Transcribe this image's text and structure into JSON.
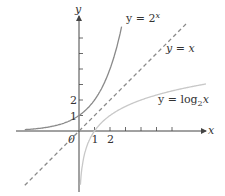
{
  "chart_data": {
    "type": "line",
    "title": "",
    "xlabel": "x",
    "ylabel": "y",
    "origin_label": "0",
    "x_tick_labels": [
      "1",
      "2"
    ],
    "y_tick_labels": [
      "1",
      "2"
    ],
    "x_ticks": [
      1,
      2,
      3,
      4,
      5,
      6
    ],
    "y_ticks": [
      1,
      2,
      3,
      4,
      5,
      6
    ],
    "xlim": [
      -4,
      8.5
    ],
    "ylim": [
      -4,
      7.5
    ],
    "grid": false,
    "series": [
      {
        "name": "y = 2^x",
        "label_base": "y = 2",
        "label_sup": "x",
        "color": "#8a8a8a",
        "style": "solid",
        "x": [
          -3.5,
          -3,
          -2,
          -1,
          0,
          1,
          2,
          2.5,
          2.75
        ],
        "y": [
          0.09,
          0.125,
          0.25,
          0.5,
          1,
          2,
          4,
          5.66,
          6.73
        ]
      },
      {
        "name": "y = x",
        "label": "y = x",
        "color": "#8a8a8a",
        "style": "dashed",
        "x": [
          -3.5,
          7
        ],
        "y": [
          -3.5,
          7
        ]
      },
      {
        "name": "y = log2 x",
        "label_base": "y = log",
        "label_sub": "2",
        "label_tail": "x",
        "color": "#c8c8c8",
        "style": "solid",
        "x": [
          0.09,
          0.125,
          0.25,
          0.5,
          1,
          2,
          4,
          5.66,
          8
        ],
        "y": [
          -3.5,
          -3,
          -2,
          -1,
          0,
          1,
          2,
          2.5,
          3
        ]
      }
    ]
  }
}
